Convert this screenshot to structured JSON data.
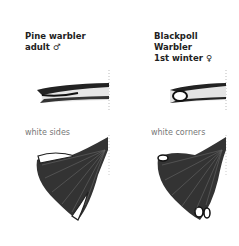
{
  "panels": [
    {
      "species_line1": "Pine warbler",
      "species_line2": "adult ♂",
      "caption": "white sides"
    },
    {
      "species_line1": "Blackpoll",
      "species_line2": "Warbler",
      "species_line3": "1st winter ♀",
      "caption": "white corners"
    }
  ]
}
